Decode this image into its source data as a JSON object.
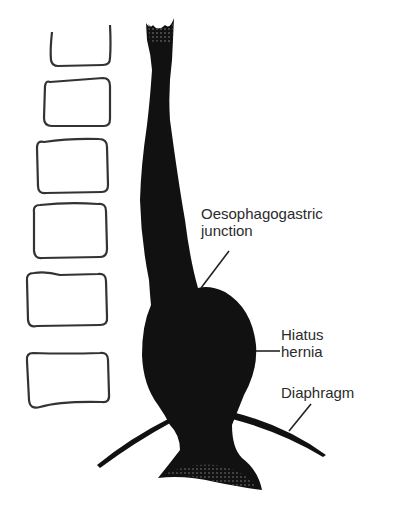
{
  "diagram": {
    "labels": {
      "oesophagogastric_junction": [
        "Oesophagogastric",
        "junction"
      ],
      "hiatus_hernia": [
        "Hiatus",
        "hernia"
      ],
      "diaphragm": "Diaphragm"
    },
    "vertebrae_count": 6,
    "colors": {
      "fill": "#111111",
      "outline": "#333333",
      "text": "#2b2b2b",
      "background": "#ffffff"
    }
  }
}
